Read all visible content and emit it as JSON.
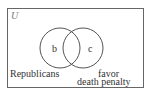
{
  "diagram": {
    "universe_label": "U",
    "regions": [
      {
        "id": "b",
        "label": "b"
      },
      {
        "id": "c",
        "label": "c"
      }
    ],
    "sets": [
      {
        "name": "Republicans",
        "label": "Republicans"
      },
      {
        "name": "favor death penalty",
        "label_line1": "favor",
        "label_line2": "death penalty"
      }
    ],
    "colors": {
      "stroke": "#555555",
      "text": "#333333",
      "background": "#ffffff"
    }
  }
}
